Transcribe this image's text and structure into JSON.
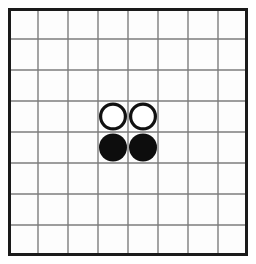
{
  "board": {
    "name": "othello-board",
    "game": "Othello / Reversi",
    "columns": 8,
    "rows": 8,
    "column_labels": [
      "a",
      "b",
      "c",
      "d",
      "e",
      "f",
      "g",
      "h"
    ],
    "row_labels": [
      "1",
      "2",
      "3",
      "4",
      "5",
      "6",
      "7",
      "8"
    ],
    "geometry": {
      "origin_x": 8,
      "origin_y": 8,
      "width": 240,
      "height": 248,
      "cell_width": 30,
      "cell_height": 31,
      "outer_border_width": 3,
      "inner_line_width": 1.4
    },
    "colors": {
      "background": "#ffffff",
      "board_fill": "#fdfdfd",
      "outer_border": "#1a1a1a",
      "grid_line": "#7d7d7d",
      "black_piece": "#0d0d0d",
      "white_piece_fill": "#ffffff",
      "white_piece_ring": "#111111"
    },
    "piece_style": {
      "radius": 14,
      "white_ring_width": 3.2
    },
    "pieces": [
      {
        "id": "piece-white-d4",
        "color": "white",
        "col": 4,
        "row": 4,
        "square": "d4"
      },
      {
        "id": "piece-white-e4",
        "color": "white",
        "col": 5,
        "row": 4,
        "square": "e4"
      },
      {
        "id": "piece-black-d5",
        "color": "black",
        "col": 4,
        "row": 5,
        "square": "d5"
      },
      {
        "id": "piece-black-e5",
        "color": "black",
        "col": 5,
        "row": 5,
        "square": "e5"
      }
    ],
    "counts": {
      "black": 2,
      "white": 2,
      "empty": 60
    }
  }
}
